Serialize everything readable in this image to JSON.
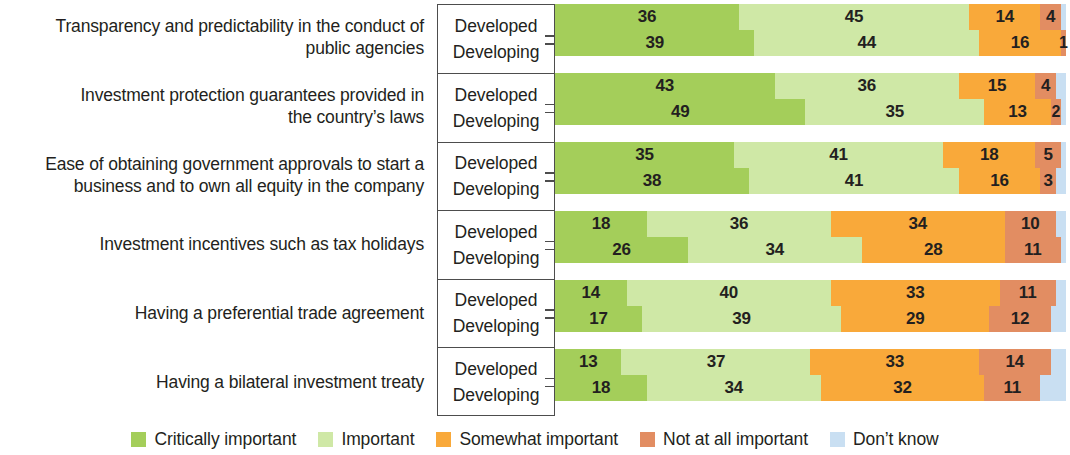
{
  "chart_data": {
    "type": "bar",
    "subtype": "stacked-horizontal-100",
    "title": "",
    "subtitle": "",
    "xlabel": "",
    "ylabel": "",
    "xlim": [
      0,
      100
    ],
    "grid": false,
    "legend_position": "bottom",
    "unit": "percent",
    "legend": [
      {
        "label": "Critically important",
        "color": "#a4ce5a"
      },
      {
        "label": "Important",
        "color": "#cfe8a6"
      },
      {
        "label": "Somewhat important",
        "color": "#f9a93a"
      },
      {
        "label": "Not at all important",
        "color": "#e28d62"
      },
      {
        "label": "Don’t know",
        "color": "#c9dff2"
      }
    ],
    "series": [
      {
        "name": "Critically important",
        "color": "#a4ce5a"
      },
      {
        "name": "Important",
        "color": "#cfe8a6"
      },
      {
        "name": "Somewhat important",
        "color": "#f9a93a"
      },
      {
        "name": "Not at all important",
        "color": "#e28d62"
      },
      {
        "name": "Don’t know",
        "color": "#c9dff2"
      }
    ],
    "subgroups": [
      "Developed",
      "Developing"
    ],
    "categories": [
      "Transparency and predictability in the conduct of public agencies",
      "Investment protection guarantees provided in the country’s laws",
      "Ease of obtaining government approvals to start a business and to own all equity in the company",
      "Investment incentives such as tax holidays",
      "Having a preferential trade agreement",
      "Having a bilateral investment treaty"
    ],
    "groups": [
      {
        "category_lines": [
          "Transparency and predictability in the conduct of",
          "public agencies"
        ],
        "rows": [
          {
            "subgroup": "Developed",
            "values": [
              36,
              45,
              14,
              4,
              1
            ]
          },
          {
            "subgroup": "Developing",
            "values": [
              39,
              44,
              16,
              1,
              0
            ]
          }
        ]
      },
      {
        "category_lines": [
          "Investment protection guarantees provided in",
          "the country’s laws"
        ],
        "rows": [
          {
            "subgroup": "Developed",
            "values": [
              43,
              36,
              15,
              4,
              2
            ]
          },
          {
            "subgroup": "Developing",
            "values": [
              49,
              35,
              13,
              2,
              1
            ]
          }
        ]
      },
      {
        "category_lines": [
          "Ease of obtaining government approvals to start a",
          "business and to own all equity in the company"
        ],
        "rows": [
          {
            "subgroup": "Developed",
            "values": [
              35,
              41,
              18,
              5,
              1
            ]
          },
          {
            "subgroup": "Developing",
            "values": [
              38,
              41,
              16,
              3,
              2
            ]
          }
        ]
      },
      {
        "category_lines": [
          "Investment incentives such as tax holidays"
        ],
        "rows": [
          {
            "subgroup": "Developed",
            "values": [
              18,
              36,
              34,
              10,
              2
            ]
          },
          {
            "subgroup": "Developing",
            "values": [
              26,
              34,
              28,
              11,
              1
            ]
          }
        ]
      },
      {
        "category_lines": [
          "Having a preferential trade agreement"
        ],
        "rows": [
          {
            "subgroup": "Developed",
            "values": [
              14,
              40,
              33,
              11,
              2
            ]
          },
          {
            "subgroup": "Developing",
            "values": [
              17,
              39,
              29,
              12,
              3
            ]
          }
        ]
      },
      {
        "category_lines": [
          "Having a bilateral investment treaty"
        ],
        "rows": [
          {
            "subgroup": "Developed",
            "values": [
              13,
              37,
              33,
              14,
              3
            ]
          },
          {
            "subgroup": "Developing",
            "values": [
              18,
              34,
              32,
              11,
              5
            ]
          }
        ]
      }
    ],
    "labeled_values": {
      "note": "Only the first four segments carry printed numbers; the Don’t know sliver is unlabeled.",
      "labels_shown_per_row": 4
    }
  }
}
